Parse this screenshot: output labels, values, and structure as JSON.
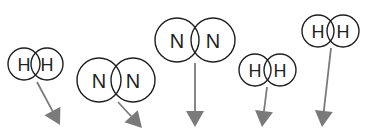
{
  "diagram": {
    "molecules": [
      {
        "id": "h2-1",
        "type": "H2",
        "atoms": [
          {
            "label": "H",
            "cx": 24,
            "cy": 64,
            "r": 16
          },
          {
            "label": "H",
            "cx": 47,
            "cy": 64,
            "r": 16
          }
        ],
        "arrow": {
          "x1": 37,
          "y1": 82,
          "x2": 60,
          "y2": 125
        }
      },
      {
        "id": "n2-1",
        "type": "N2",
        "atoms": [
          {
            "label": "N",
            "cx": 99,
            "cy": 80,
            "r": 22
          },
          {
            "label": "N",
            "cx": 133,
            "cy": 80,
            "r": 22
          }
        ],
        "arrow": {
          "x1": 118,
          "y1": 102,
          "x2": 142,
          "y2": 128
        }
      },
      {
        "id": "n2-2",
        "type": "N2",
        "atoms": [
          {
            "label": "N",
            "cx": 177,
            "cy": 40,
            "r": 22
          },
          {
            "label": "N",
            "cx": 213,
            "cy": 40,
            "r": 22
          }
        ],
        "arrow": {
          "x1": 195,
          "y1": 63,
          "x2": 195,
          "y2": 127
        }
      },
      {
        "id": "h2-2",
        "type": "H2",
        "atoms": [
          {
            "label": "H",
            "cx": 255,
            "cy": 70,
            "r": 16
          },
          {
            "label": "H",
            "cx": 280,
            "cy": 70,
            "r": 16
          }
        ],
        "arrow": {
          "x1": 267,
          "y1": 87,
          "x2": 262,
          "y2": 127
        }
      },
      {
        "id": "h2-3",
        "type": "H2",
        "atoms": [
          {
            "label": "H",
            "cx": 318,
            "cy": 31,
            "r": 16
          },
          {
            "label": "H",
            "cx": 343,
            "cy": 31,
            "r": 16
          }
        ],
        "arrow": {
          "x1": 331,
          "y1": 48,
          "x2": 322,
          "y2": 127
        }
      }
    ],
    "colors": {
      "outline": "#1f1f1f",
      "arrow": "#7a7a7a",
      "background": "#ffffff"
    }
  }
}
